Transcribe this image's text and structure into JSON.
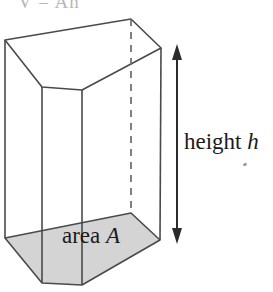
{
  "figure": {
    "name": "pentagonal-prism-volume-diagram",
    "title_clipped": "V = Ah",
    "labels": {
      "height": "height",
      "height_variable": "h",
      "area": "area",
      "area_variable": "A"
    },
    "colors": {
      "outline": "#4a4a4a",
      "base_fill": "#d4d4d4",
      "background": "#ffffff",
      "text": "#1a1a1a",
      "arrow": "#2b2b2b",
      "hidden_edge": "#6b6b6b"
    },
    "geometry": {
      "top_face": "5,40 42,87 82,90 161,48 131,19",
      "bottom_face": "5,238 42,283 82,285 160,240 131,213",
      "vertical_edges": [
        {
          "name": "left-back-edge",
          "x1": 5,
          "y1": 40,
          "x2": 5,
          "y2": 238
        },
        {
          "name": "front-left-edge",
          "x1": 42,
          "y1": 87,
          "x2": 42,
          "y2": 283
        },
        {
          "name": "front-right-edge",
          "x1": 82,
          "y1": 90,
          "x2": 82,
          "y2": 285
        },
        {
          "name": "right-back-edge",
          "x1": 161,
          "y1": 48,
          "x2": 160,
          "y2": 240
        }
      ],
      "hidden_edge": {
        "x1": 131,
        "y1": 19,
        "x2": 131,
        "y2": 213
      },
      "height_arrow": {
        "x": 177,
        "y_top": 48,
        "y_bottom": 240
      }
    }
  }
}
